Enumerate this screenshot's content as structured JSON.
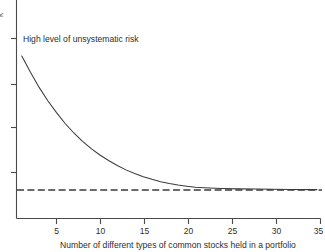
{
  "figure": {
    "background_color": "#ffffff",
    "ink_color": "#3b3b3b",
    "axis_color": "#4a4a4a"
  },
  "chart_data": {
    "type": "line",
    "title": "",
    "subtitle": "",
    "xlabel": "Number of different types of common stocks held in a portfolio",
    "ylabel": "Risk",
    "xlim": [
      0,
      35
    ],
    "ylim": [
      0,
      1
    ],
    "grid": false,
    "legend_position": "none",
    "xticks": [
      5,
      10,
      15,
      20,
      25,
      30,
      35
    ],
    "xticklabels": [
      "5",
      "10",
      "15",
      "20",
      "25",
      "30",
      "35"
    ],
    "yticks": [
      0.25,
      0.45,
      0.65,
      0.85
    ],
    "yticklabels": [
      "",
      "",
      "",
      ""
    ],
    "annotations": [
      {
        "name": "unsystematic-risk-label",
        "text": "High level of unsystematic risk",
        "x": 1.0,
        "y": 0.88
      }
    ],
    "series": [
      {
        "name": "Total portfolio risk",
        "style": "solid",
        "x": [
          1,
          2,
          3,
          4,
          5,
          6,
          7,
          8,
          9,
          10,
          11,
          12,
          13,
          14,
          15,
          16,
          17,
          18,
          19,
          20,
          21,
          22,
          24,
          26,
          28,
          30,
          32,
          35
        ],
        "y": [
          0.855,
          0.77,
          0.69,
          0.62,
          0.557,
          0.5,
          0.45,
          0.406,
          0.368,
          0.334,
          0.305,
          0.279,
          0.256,
          0.237,
          0.22,
          0.206,
          0.194,
          0.184,
          0.176,
          0.17,
          0.165,
          0.162,
          0.158,
          0.156,
          0.155,
          0.154,
          0.153,
          0.152
        ]
      },
      {
        "name": "Systematic (market) risk",
        "style": "dashed",
        "x": [
          0,
          35
        ],
        "y": [
          0.15,
          0.15
        ]
      }
    ]
  },
  "axis_caption": "Number of different types of common stocks held in a portfolio",
  "annotation_label": "High level of unsystematic risk",
  "x_tick_labels": [
    "5",
    "10",
    "15",
    "20",
    "25",
    "30",
    "35"
  ],
  "y_axis_clipped_label": "k"
}
